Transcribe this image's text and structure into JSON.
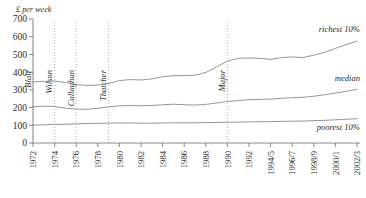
{
  "chart_data": {
    "type": "line",
    "title": "",
    "subtitle": "",
    "xlabel": "",
    "ylabel": "£ per week",
    "ylim": [
      0,
      700
    ],
    "yticks": [
      0,
      100,
      200,
      300,
      400,
      500,
      600,
      700
    ],
    "grid": false,
    "legend_position": "inline-right",
    "categories": [
      "1972",
      "1973",
      "1974",
      "1975",
      "1976",
      "1977",
      "1978",
      "1979",
      "1980",
      "1981",
      "1982",
      "1983",
      "1984",
      "1985",
      "1986",
      "1987",
      "1988",
      "1989",
      "1990",
      "1991",
      "1992",
      "1993",
      "1994/5",
      "1995/6",
      "1996/7",
      "1997/8",
      "1998/9",
      "1999/0",
      "2000/1",
      "2001/2",
      "2002/3"
    ],
    "xticks": [
      "1972",
      "1974",
      "1976",
      "1978",
      "1980",
      "1982",
      "1984",
      "1986",
      "1988",
      "1990",
      "1992",
      "1994/5",
      "1996/7",
      "1998/9",
      "2000/1",
      "2002/3"
    ],
    "series": [
      {
        "name": "richest 10%",
        "values": [
          345,
          348,
          350,
          342,
          330,
          325,
          327,
          336,
          352,
          358,
          356,
          362,
          374,
          380,
          380,
          383,
          398,
          430,
          462,
          478,
          480,
          478,
          472,
          482,
          486,
          482,
          496,
          512,
          534,
          556,
          575
        ]
      },
      {
        "name": "median",
        "values": [
          205,
          208,
          206,
          197,
          192,
          190,
          196,
          204,
          210,
          212,
          210,
          212,
          216,
          219,
          216,
          214,
          218,
          226,
          234,
          240,
          244,
          246,
          248,
          252,
          256,
          258,
          264,
          272,
          282,
          292,
          303
        ]
      },
      {
        "name": "poorest 10%",
        "values": [
          100,
          103,
          105,
          106,
          108,
          110,
          111,
          112,
          113,
          113,
          112,
          112,
          113,
          114,
          114,
          114,
          115,
          116,
          117,
          118,
          119,
          120,
          121,
          122,
          123,
          124,
          126,
          128,
          131,
          134,
          137
        ]
      }
    ],
    "annotations": [
      {
        "label": "Wilson",
        "x_year": "1974"
      },
      {
        "label": "Callaghan",
        "x_year": "1976"
      },
      {
        "label": "Thatcher",
        "x_year": "1979"
      },
      {
        "label": "Major",
        "x_year": "1990"
      },
      {
        "label": "Blair",
        "x_year": "1997"
      }
    ]
  }
}
